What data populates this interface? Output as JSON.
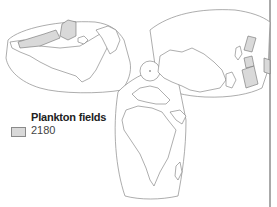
{
  "map": {
    "projection": "butterfly",
    "colors": {
      "background": "#ffffff",
      "outline": "#8a8a8a",
      "land_stroke": "#777777",
      "field_fill": "#d9d9d9"
    }
  },
  "legend": {
    "title": "Plankton fields",
    "items": [
      {
        "label": "2180",
        "swatch_color": "#d9d9d9"
      }
    ]
  }
}
